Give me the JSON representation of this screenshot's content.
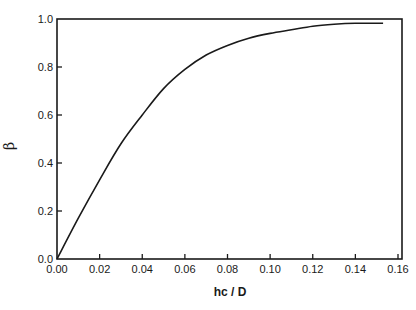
{
  "chart_data": {
    "type": "line",
    "title": "",
    "xlabel": "hc / D",
    "ylabel": "β",
    "xlim": [
      0,
      0.165
    ],
    "ylim": [
      0,
      1.0
    ],
    "xticks": [
      "0.00",
      "0.02",
      "0.04",
      "0.06",
      "0.08",
      "0.10",
      "0.12",
      "0.14",
      "0.16"
    ],
    "yticks": [
      "0.0",
      "0.2",
      "0.4",
      "0.6",
      "0.8",
      "1.0"
    ],
    "grid": false,
    "legend": null,
    "series": [
      {
        "name": "β vs hc/D",
        "x": [
          0.0,
          0.01,
          0.02,
          0.03,
          0.04,
          0.05,
          0.06,
          0.07,
          0.08,
          0.09,
          0.1,
          0.11,
          0.12,
          0.13,
          0.14,
          0.153
        ],
        "y": [
          0.0,
          0.17,
          0.33,
          0.48,
          0.6,
          0.71,
          0.79,
          0.85,
          0.89,
          0.92,
          0.94,
          0.955,
          0.97,
          0.978,
          0.982,
          0.982
        ]
      }
    ]
  }
}
